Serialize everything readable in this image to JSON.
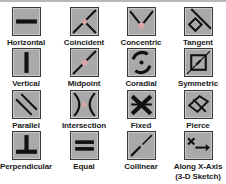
{
  "constraints": [
    {
      "label": "Horizontal",
      "icon": "horizontal-icon"
    },
    {
      "label": "Coincident",
      "icon": "coincident-icon"
    },
    {
      "label": "Concentric",
      "icon": "concentric-icon"
    },
    {
      "label": "Tangent",
      "icon": "tangent-icon"
    },
    {
      "label": "Vertical",
      "icon": "vertical-icon"
    },
    {
      "label": "Midpoint",
      "icon": "midpoint-icon"
    },
    {
      "label": "Coradial",
      "icon": "coradial-icon"
    },
    {
      "label": "Symmetric",
      "icon": "symmetric-icon"
    },
    {
      "label": "Parallel",
      "icon": "parallel-icon"
    },
    {
      "label": "Intersection",
      "icon": "intersection-icon"
    },
    {
      "label": "Fixed",
      "icon": "fixed-icon"
    },
    {
      "label": "Pierce",
      "icon": "pierce-icon"
    },
    {
      "label": "Perpendicular",
      "icon": "perpendicular-icon"
    },
    {
      "label": "Equal",
      "icon": "equal-icon"
    },
    {
      "label": "Collinear",
      "icon": "collinear-icon"
    },
    {
      "label": "Along X-Axis",
      "label_line2": "(3-D Sketch)",
      "icon": "along-x-axis-icon"
    }
  ],
  "colors": {
    "icon_fill": "#a9a9a9",
    "icon_border": "#3a3a3a",
    "glyph": "#111111",
    "point": "#d9a6a6"
  }
}
